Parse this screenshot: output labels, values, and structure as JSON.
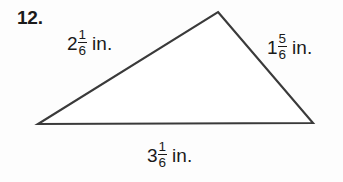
{
  "problem": {
    "number": "12."
  },
  "figure": {
    "shape_name": "triangle",
    "stroke_color": "#3a3a3a",
    "fill_color": "#ffffff",
    "vertices": {
      "apex": {
        "x": 218,
        "y": 12
      },
      "bottom_left": {
        "x": 38,
        "y": 124
      },
      "bottom_right": {
        "x": 313,
        "y": 123
      }
    }
  },
  "labels": {
    "left_side": {
      "whole": "2",
      "numerator": "1",
      "denominator": "6",
      "unit": "in.",
      "full_text": "2 1/6 in."
    },
    "right_side": {
      "whole": "1",
      "numerator": "5",
      "denominator": "6",
      "unit": "in.",
      "full_text": "1 5/6 in."
    },
    "bottom_side": {
      "whole": "3",
      "numerator": "1",
      "denominator": "6",
      "unit": "in.",
      "full_text": "3 1/6 in."
    }
  }
}
